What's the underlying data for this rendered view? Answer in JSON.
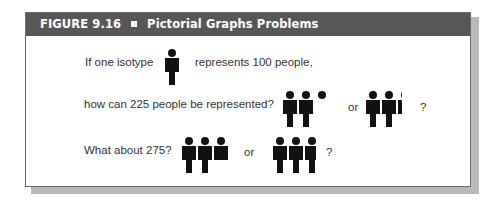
{
  "figure": {
    "label": "FIGURE 9.16",
    "separator_icon": "square-bullet-icon",
    "title": "Pictorial Graphs Problems"
  },
  "rows": [
    {
      "before": "If one isotype",
      "after": "represents 100 people,"
    },
    {
      "question": "how can 225 people be represented?",
      "or": "or",
      "end": "?"
    },
    {
      "question": "What about 275?",
      "or": "or",
      "end": "?"
    }
  ],
  "isotype": {
    "icon": "person-isotype-icon",
    "value": 100,
    "unit": "people"
  },
  "colors": {
    "header_bg": "#575757",
    "header_text": "#ffffff",
    "isotype": "#111111",
    "shadow": "#b9b9b9"
  }
}
